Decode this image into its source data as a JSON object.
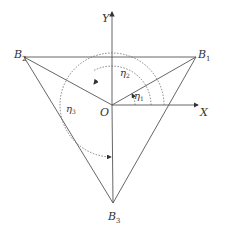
{
  "diagram": {
    "axes": {
      "x_label": "X",
      "y_label": "Y",
      "origin_label": "O"
    },
    "points": [
      {
        "name": "B",
        "sub": "1"
      },
      {
        "name": "B",
        "sub": "2"
      },
      {
        "name": "B",
        "sub": "3"
      }
    ],
    "angles": [
      {
        "name": "η",
        "sub": "1"
      },
      {
        "name": "η",
        "sub": "2"
      },
      {
        "name": "η",
        "sub": "3"
      }
    ]
  }
}
